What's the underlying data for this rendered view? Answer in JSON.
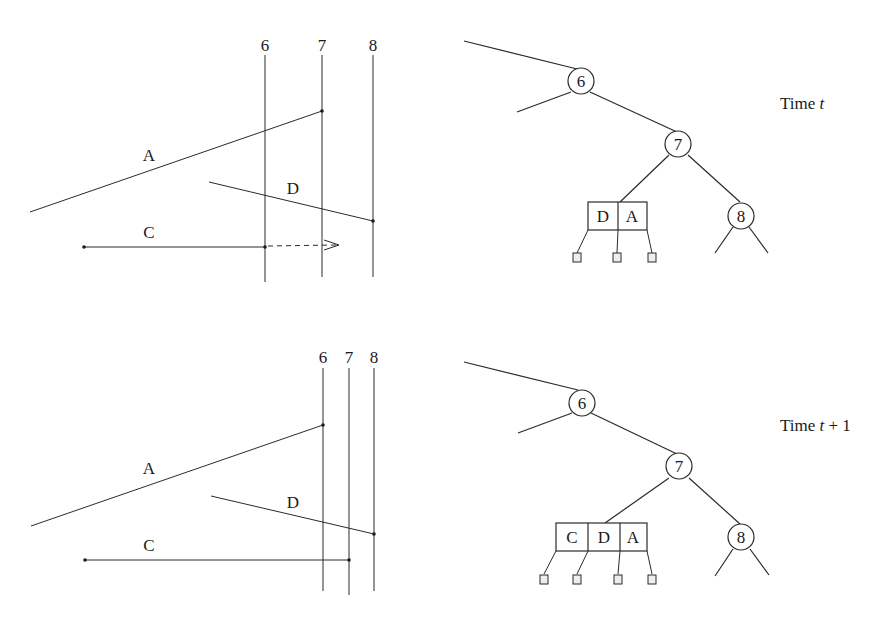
{
  "panels": [
    {
      "name": "time-t",
      "caption": {
        "prefix": "Time ",
        "var": "t",
        "suffix": ""
      },
      "sweep_lines": [
        {
          "label": "6",
          "x": 265
        },
        {
          "label": "7",
          "x": 322
        },
        {
          "label": "8",
          "x": 373
        }
      ],
      "segments": {
        "A": {
          "label": "A"
        },
        "D": {
          "label": "D"
        },
        "C": {
          "label": "C"
        }
      },
      "tree": {
        "nodes": [
          "6",
          "7",
          "8"
        ],
        "bucket": [
          "D",
          "A"
        ]
      }
    },
    {
      "name": "time-t-plus-1",
      "caption": {
        "prefix": "Time ",
        "var": "t",
        "suffix": " + 1"
      },
      "sweep_lines": [
        {
          "label": "6",
          "x": 323
        },
        {
          "label": "7",
          "x": 349
        },
        {
          "label": "8",
          "x": 374
        }
      ],
      "segments": {
        "A": {
          "label": "A"
        },
        "D": {
          "label": "D"
        },
        "C": {
          "label": "C"
        }
      },
      "tree": {
        "nodes": [
          "6",
          "7",
          "8"
        ],
        "bucket": [
          "C",
          "D",
          "A"
        ]
      }
    }
  ]
}
